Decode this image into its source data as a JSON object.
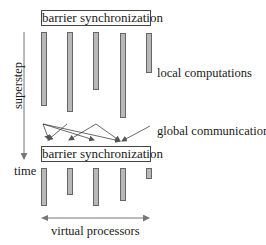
{
  "diagram": {
    "top_barrier": "barrier synchronization",
    "bottom_barrier": "barrier synchronization",
    "local_label": "local computations",
    "global_label": "global communication",
    "axis_label": "superstep",
    "time_label": "time",
    "processors_label": "virtual processors",
    "colors": {
      "bar_fill": "#b8b8b8",
      "bar_border": "#666666",
      "line": "#555555"
    },
    "top_bars": [
      {
        "x": 41,
        "y": 32,
        "h": 74
      },
      {
        "x": 67,
        "y": 32,
        "h": 80
      },
      {
        "x": 93,
        "y": 32,
        "h": 58
      },
      {
        "x": 120,
        "y": 33,
        "h": 85
      },
      {
        "x": 146,
        "y": 33,
        "h": 40
      }
    ],
    "bottom_bars": [
      {
        "x": 41,
        "y": 168,
        "h": 38
      },
      {
        "x": 67,
        "y": 168,
        "h": 27
      },
      {
        "x": 93,
        "y": 168,
        "h": 38
      },
      {
        "x": 120,
        "y": 168,
        "h": 33
      },
      {
        "x": 146,
        "y": 168,
        "h": 11
      }
    ]
  }
}
